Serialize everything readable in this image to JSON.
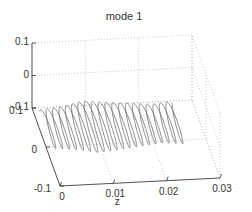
{
  "chart_data": {
    "type": "line",
    "projection": "3d",
    "title": "mode 1",
    "xlabel": "z",
    "ylabel": "",
    "zlabel": "",
    "x_axis": {
      "label": "z",
      "range": [
        0,
        0.03
      ],
      "ticks": [
        0,
        0.01,
        0.02,
        0.03
      ],
      "tick_labels": [
        "0",
        "0.01",
        "0.02",
        "0.03"
      ]
    },
    "y_axis": {
      "label": "",
      "range": [
        -0.1,
        0.1
      ],
      "ticks": [
        -0.1,
        0,
        0.1
      ],
      "tick_labels": [
        "-0.1",
        "0",
        "0.1"
      ]
    },
    "v_axis": {
      "label": "",
      "range": [
        -0.1,
        0.1
      ],
      "ticks": [
        -0.1,
        0,
        0.1
      ],
      "tick_labels": [
        "-0.1",
        "0",
        "0.1"
      ]
    },
    "grid": true,
    "legend": "none",
    "series": [
      {
        "name": "mode 1 helix",
        "description": "helical coil along z from 0 to ~0.025 with ~20 turns, amplitude modulated",
        "z_range": [
          0.0,
          0.025
        ],
        "turns": 20,
        "amplitude_envelope": [
          0.045,
          0.05,
          0.06,
          0.055,
          0.05,
          0.045,
          0.05
        ]
      }
    ],
    "color": "#6a6a6a"
  }
}
